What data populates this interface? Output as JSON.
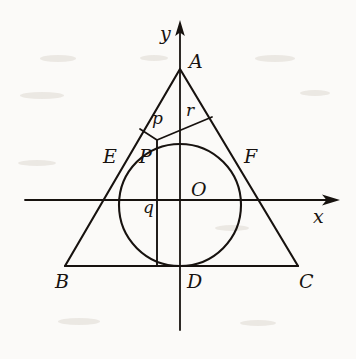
{
  "figure": {
    "background_color": "#fbfaf8",
    "ink_color": "#17120f"
  },
  "axes": {
    "x_axis": {
      "label": "x",
      "label_x": 313,
      "label_y": 207,
      "y": 200,
      "x_start": 25,
      "x_end": 338
    },
    "y_axis": {
      "label": "y",
      "label_x": 160,
      "label_y": 24,
      "x": 180,
      "y_start": 22,
      "y_end": 330
    }
  },
  "points": [
    {
      "id": "A",
      "label": "A",
      "x": 180,
      "y": 69,
      "label_x": 189,
      "label_y": 52
    },
    {
      "id": "B",
      "label": "B",
      "x": 65,
      "y": 266,
      "label_x": 55,
      "label_y": 272
    },
    {
      "id": "C",
      "label": "C",
      "x": 298,
      "y": 266,
      "label_x": 299,
      "label_y": 272
    },
    {
      "id": "D",
      "label": "D",
      "x": 180,
      "y": 266,
      "label_x": 187,
      "label_y": 272
    },
    {
      "id": "E",
      "label": "E",
      "x": 122,
      "y": 167,
      "label_x": 103,
      "label_y": 147
    },
    {
      "id": "F",
      "label": "F",
      "x": 238,
      "y": 167,
      "label_x": 244,
      "label_y": 147
    },
    {
      "id": "O",
      "label": "O",
      "x": 180,
      "y": 205,
      "label_x": 191,
      "label_y": 180
    },
    {
      "id": "P",
      "label": "P",
      "x": 157,
      "y": 155,
      "label_x": 139,
      "label_y": 147
    }
  ],
  "segments": [
    {
      "id": "p",
      "label": "p",
      "label_x": 152,
      "label_y": 110,
      "desc": "segment-from-P-to-A-side"
    },
    {
      "id": "r",
      "label": "r",
      "label_x": 186,
      "label_y": 102,
      "desc": "segment-from-P-to-AC"
    },
    {
      "id": "q",
      "label": "q",
      "label_x": 143,
      "label_y": 199,
      "desc": "vertical-segment-P-to-BC"
    }
  ],
  "circle": {
    "center_x": 180,
    "center_y": 205,
    "radius": 61,
    "name": "inscribed-circle"
  },
  "triangle": {
    "name": "triangle-ABC",
    "vertices": "A(180,69) B(65,266) C(298,266)"
  }
}
